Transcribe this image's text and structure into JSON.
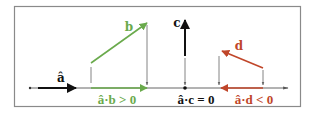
{
  "colors": {
    "frame": "#8a8a8a",
    "axis": "#555555",
    "black": "#111111",
    "green": "#6aaa4c",
    "red": "#c0462a",
    "drop": "#666666"
  },
  "vectors": {
    "a_hat": {
      "label": "â"
    },
    "b": {
      "label": "b"
    },
    "c": {
      "label": "c"
    },
    "d": {
      "label": "d"
    }
  },
  "equations": {
    "ab": "â·b > 0",
    "ac": "â·c = 0",
    "ad": "â·d < 0"
  }
}
